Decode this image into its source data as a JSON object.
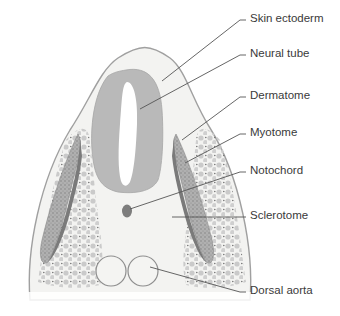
{
  "diagram": {
    "labels": [
      {
        "id": "skin-ectoderm",
        "text": "Skin ectoderm",
        "x": 250,
        "y": 17
      },
      {
        "id": "neural-tube",
        "text": "Neural tube",
        "x": 250,
        "y": 51
      },
      {
        "id": "dermatome",
        "text": "Dermatome",
        "x": 250,
        "y": 93
      },
      {
        "id": "myotome",
        "text": "Myotome",
        "x": 250,
        "y": 130
      },
      {
        "id": "notochord",
        "text": "Notochord",
        "x": 250,
        "y": 168
      },
      {
        "id": "sclerotome",
        "text": "Sclerotome",
        "x": 250,
        "y": 213
      },
      {
        "id": "dorsal-aorta",
        "text": "Dorsal aorta",
        "x": 250,
        "y": 288
      }
    ],
    "colors": {
      "ectoderm_line": "#9a9a9a",
      "mesenchyme_fill": "#f3f3f1",
      "neural_tube_fill": "#b9b9b9",
      "neural_tube_lumen": "#ffffff",
      "dermamyotome_fill": "#a8a8a8",
      "myotome_dark": "#7a7a7a",
      "sclerotome_cells": "#c8c8c8",
      "notochord_fill": "#7d7d7d",
      "aorta_stroke": "#8e8e8e",
      "aorta_fill": "#f4f4f2",
      "leader_line": "#555555",
      "label_text": "#3a3a3a"
    }
  }
}
